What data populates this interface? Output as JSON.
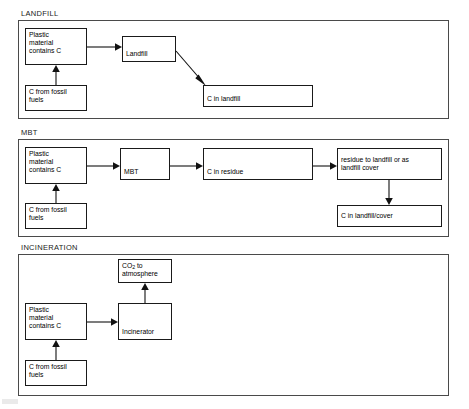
{
  "diagram": {
    "title_present": false,
    "sections": [
      {
        "id": "landfill",
        "label": "LANDFILL",
        "boxes": [
          {
            "id": "lf-plastic",
            "text": "Plastic\nmaterial\ncontains C"
          },
          {
            "id": "lf-fossil",
            "text": "C from fossil\nfuels"
          },
          {
            "id": "lf-process",
            "text": "Landfill"
          },
          {
            "id": "lf-sink",
            "text": "C in landfill"
          }
        ]
      },
      {
        "id": "mbt",
        "label": "MBT",
        "boxes": [
          {
            "id": "mbt-plastic",
            "text": "Plastic\nmaterial\ncontains C"
          },
          {
            "id": "mbt-fossil",
            "text": "C from fossil\nfuels"
          },
          {
            "id": "mbt-process",
            "text": "MBT"
          },
          {
            "id": "mbt-residue",
            "text": "C in residue"
          },
          {
            "id": "mbt-route",
            "text": "residue to landfill or as\nlandfill cover"
          },
          {
            "id": "mbt-sink",
            "text": "C in landfill/cover"
          }
        ]
      },
      {
        "id": "incineration",
        "label": "INCINERATION",
        "boxes": [
          {
            "id": "inc-plastic",
            "text": "Plastic\nmaterial\ncontains C"
          },
          {
            "id": "inc-fossil",
            "text": "C from fossil\nfuels"
          },
          {
            "id": "inc-process",
            "text": "Incinerator"
          },
          {
            "id": "inc-co2_prefix",
            "text": "CO"
          },
          {
            "id": "inc-co2_sub",
            "text": "2"
          },
          {
            "id": "inc-co2_suffix",
            "text": " to\natmosphere"
          }
        ]
      }
    ],
    "colors": {
      "box_border": "#1a1a1a",
      "frame_border": "#4a4a4a",
      "connector": "#111111",
      "background": "#ffffff",
      "text": "#000000"
    }
  }
}
